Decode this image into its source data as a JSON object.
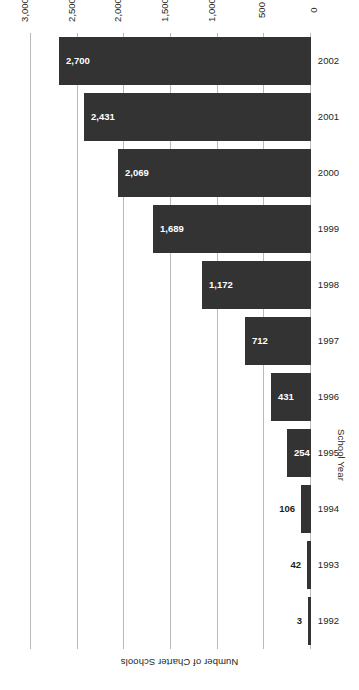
{
  "chart_data": {
    "type": "bar",
    "orientation": "horizontal",
    "title": "",
    "xlabel": "Number of Charter Schools",
    "ylabel": "School Year",
    "categories": [
      "1992",
      "1993",
      "1994",
      "1995",
      "1996",
      "1997",
      "1998",
      "1999",
      "2000",
      "2001",
      "2002"
    ],
    "values": [
      3,
      42,
      106,
      254,
      431,
      712,
      1172,
      1689,
      2069,
      2431,
      2700
    ],
    "value_labels": [
      "3",
      "42",
      "106",
      "254",
      "431",
      "712",
      "1,172",
      "1,689",
      "2,069",
      "2,431",
      "2,700"
    ],
    "label_placement": [
      "outside",
      "outside",
      "outside",
      "inside",
      "inside",
      "inside",
      "inside",
      "inside",
      "inside",
      "inside",
      "inside"
    ],
    "xlim": [
      0,
      3000
    ],
    "ticks": [
      0,
      500,
      1000,
      1500,
      2000,
      2500,
      3000
    ],
    "tick_labels": [
      "0",
      "500",
      "1,000",
      "1,500",
      "2,000",
      "2,500",
      "3,000"
    ],
    "grid": true,
    "legend": false,
    "bar_color": "#333333",
    "gridline_color": "#b9b9b9",
    "background_color": "#ffffff",
    "inside_label_color": "#ffffff",
    "outside_label_color": "#231f20",
    "rotation_deg": 180
  }
}
